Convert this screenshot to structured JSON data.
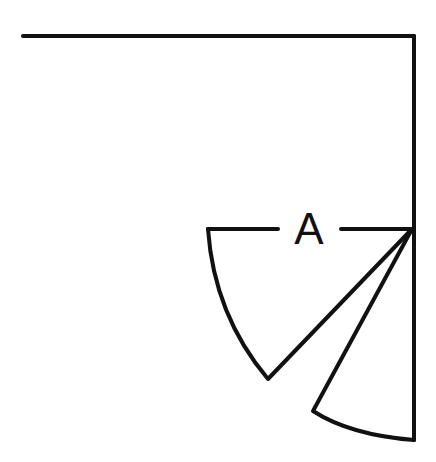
{
  "diagram": {
    "type": "door-swing-plan-symbol",
    "label": "A",
    "stroke_color": "#111111",
    "background": "#ffffff",
    "elements": [
      {
        "name": "top-wall",
        "description": "horizontal wall line across top"
      },
      {
        "name": "right-wall",
        "description": "vertical wall line on right edge"
      },
      {
        "name": "opening-line",
        "description": "horizontal line at hinge with label A"
      },
      {
        "name": "door-leaf-large",
        "description": "larger swing sector with arc"
      },
      {
        "name": "door-leaf-small",
        "description": "smaller swing sector with arc"
      }
    ]
  }
}
